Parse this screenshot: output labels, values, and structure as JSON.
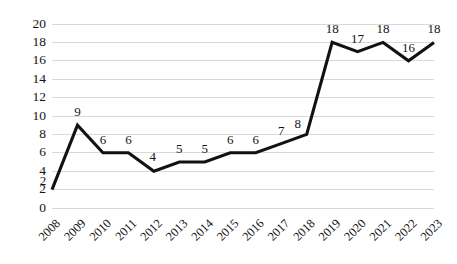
{
  "chart_data": {
    "type": "line",
    "title": "",
    "subtitle": "",
    "xlabel": "",
    "ylabel": "",
    "categories": [
      "2008",
      "2009",
      "2010",
      "2011",
      "2012",
      "2013",
      "2014",
      "2015",
      "2016",
      "2017",
      "2018",
      "2019",
      "2020",
      "2021",
      "2022",
      "2023"
    ],
    "values": [
      2,
      9,
      6,
      6,
      4,
      5,
      5,
      6,
      6,
      7,
      8,
      18,
      17,
      18,
      16,
      18
    ],
    "data_labels": [
      "2",
      "9",
      "6",
      "6",
      "4",
      "5",
      "5",
      "6",
      "6",
      "7",
      "8",
      "18",
      "17",
      "18",
      "16",
      "18"
    ],
    "ylim": [
      0,
      20
    ],
    "ytick_step": 2,
    "ytick_labels": [
      "0",
      "2",
      "4",
      "6",
      "8",
      "10",
      "12",
      "14",
      "16",
      "18",
      "20"
    ],
    "grid": "horizontal",
    "legend": "none",
    "series": [
      {
        "name": "series-1",
        "values": [
          2,
          9,
          6,
          6,
          4,
          5,
          5,
          6,
          6,
          7,
          8,
          18,
          17,
          18,
          16,
          18
        ],
        "color": "#121212"
      }
    ],
    "colors": {
      "line": "#121212",
      "gridline": "#d9d9d9",
      "text": "#141414",
      "background": "#ffffff"
    },
    "xtick_rotation_deg": -45
  }
}
